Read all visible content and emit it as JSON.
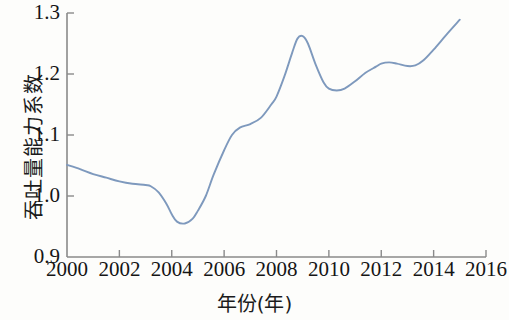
{
  "chart_data": {
    "type": "line",
    "title": "",
    "xlabel": "年份(年)",
    "ylabel": "吞吐量能力系数",
    "xlim": [
      2000,
      2016
    ],
    "ylim": [
      0.9,
      1.3
    ],
    "grid": false,
    "legend": null,
    "line_color": "#7e99bd",
    "axis_color": "#8a8a8a",
    "background": "#fdfdfb",
    "xticks": [
      2000,
      2002,
      2004,
      2006,
      2008,
      2010,
      2012,
      2014,
      2016
    ],
    "xtick_labels": [
      "2000",
      "2002",
      "2004",
      "2006",
      "2008",
      "2010",
      "2012",
      "2014",
      "2016"
    ],
    "yticks": [
      0.9,
      1.0,
      1.1,
      1.2,
      1.3
    ],
    "ytick_labels": [
      "0.9",
      "1.0",
      "1.1",
      "1.2",
      "1.3"
    ],
    "series": [
      {
        "name": "吞吐量能力系数",
        "x": [
          2000.0,
          2000.5,
          2001.0,
          2001.5,
          2002.0,
          2002.5,
          2003.0,
          2003.2,
          2003.5,
          2003.8,
          2004.0,
          2004.2,
          2004.5,
          2004.8,
          2005.0,
          2005.3,
          2005.6,
          2006.0,
          2006.3,
          2006.6,
          2007.0,
          2007.4,
          2007.8,
          2008.0,
          2008.3,
          2008.6,
          2008.8,
          2009.0,
          2009.2,
          2009.5,
          2009.8,
          2010.0,
          2010.3,
          2010.6,
          2011.0,
          2011.4,
          2011.8,
          2012.0,
          2012.3,
          2012.6,
          2013.0,
          2013.3,
          2013.6,
          2014.0,
          2014.5,
          2015.0
        ],
        "y": [
          1.051,
          1.044,
          1.036,
          1.03,
          1.024,
          1.02,
          1.018,
          1.016,
          1.006,
          0.987,
          0.97,
          0.958,
          0.955,
          0.963,
          0.976,
          1.0,
          1.035,
          1.075,
          1.1,
          1.112,
          1.118,
          1.128,
          1.15,
          1.163,
          1.196,
          1.235,
          1.258,
          1.262,
          1.25,
          1.215,
          1.186,
          1.176,
          1.173,
          1.176,
          1.188,
          1.202,
          1.212,
          1.217,
          1.219,
          1.217,
          1.213,
          1.214,
          1.222,
          1.24,
          1.265,
          1.289
        ]
      }
    ],
    "annotations": {
      "minimum": {
        "x": 2004.5,
        "y": 0.955
      },
      "peak": {
        "x": 2009.0,
        "y": 1.262
      },
      "end": {
        "x": 2015.0,
        "y": 1.289
      },
      "start": {
        "x": 2000.0,
        "y": 1.051
      }
    }
  },
  "axis_titles": {
    "x": "年份(年)",
    "y": "吞吐量能力系数"
  }
}
